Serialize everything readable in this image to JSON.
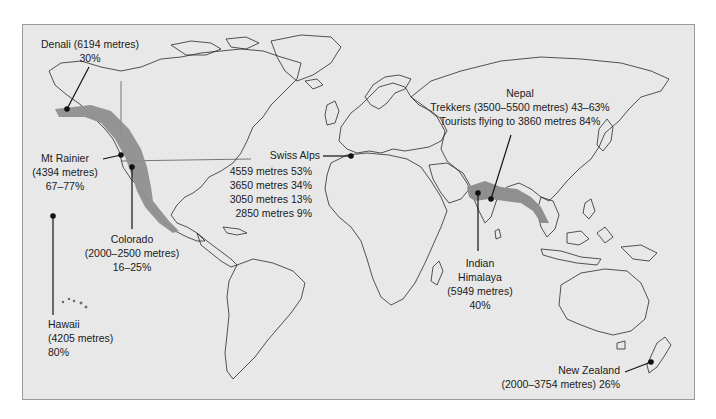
{
  "map": {
    "title": "World map of acute mountain sickness prevalence",
    "background": "#e8e8e8",
    "land_stroke": "#2a2a2a",
    "region_fill": "#8f8f8f",
    "frame_border": "#9a9a9a"
  },
  "annotations": {
    "denali": {
      "name": "Denali (6194 metres)",
      "value": "30%"
    },
    "rainier": {
      "name": "Mt Rainier",
      "altitude": "(4394 metres)",
      "value": "67–77%"
    },
    "colorado": {
      "name": "Colorado",
      "altitude": "(2000–2500 metres)",
      "value": "16–25%"
    },
    "hawaii": {
      "name": "Hawaii",
      "altitude": "(4205 metres)",
      "value": "80%"
    },
    "swiss": {
      "name": "Swiss Alps",
      "rows": [
        "4559 metres 53%",
        "3650 metres 34%",
        "3050 metres 13%",
        "2850 metres 9%"
      ]
    },
    "nepal": {
      "name": "Nepal",
      "trekkers": "Trekkers (3500–5500 metres) 43–63%",
      "tourists": "Tourists flying to 3860 metres 84%"
    },
    "indian_himalaya": {
      "line1": "Indian",
      "line2": "Himalaya",
      "altitude": "(5949 metres)",
      "value": "40%"
    },
    "new_zealand": {
      "name": "New Zealand",
      "altitude_value": "(2000–3754 metres) 26%"
    }
  }
}
